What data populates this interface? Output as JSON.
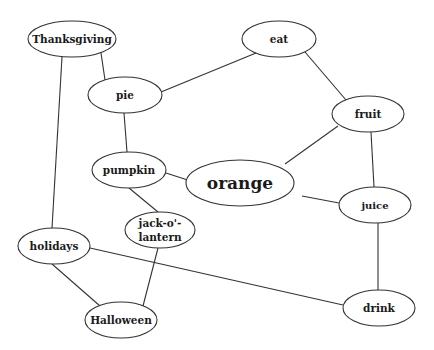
{
  "diagram": {
    "type": "concept-map",
    "nodes": [
      {
        "id": "thanksgiving",
        "label": "Thanksgiving",
        "cx": 72,
        "cy": 39,
        "rx": 44,
        "ry": 18,
        "size": 10.5
      },
      {
        "id": "eat",
        "label": "eat",
        "cx": 279,
        "cy": 39,
        "rx": 37,
        "ry": 18,
        "size": 10.5
      },
      {
        "id": "pie",
        "label": "pie",
        "cx": 125,
        "cy": 95,
        "rx": 37,
        "ry": 18,
        "size": 10.5
      },
      {
        "id": "fruit",
        "label": "fruit",
        "cx": 368,
        "cy": 114,
        "rx": 36,
        "ry": 18,
        "size": 10.5
      },
      {
        "id": "pumpkin",
        "label": "pumpkin",
        "cx": 129,
        "cy": 170,
        "rx": 37,
        "ry": 18,
        "size": 10.5
      },
      {
        "id": "orange",
        "label": "orange",
        "cx": 240,
        "cy": 183,
        "rx": 54,
        "ry": 23,
        "size": 17
      },
      {
        "id": "juice",
        "label": "juice",
        "cx": 375,
        "cy": 205,
        "rx": 36,
        "ry": 18,
        "size": 10
      },
      {
        "id": "jack",
        "label": "jack-o'-",
        "label2": "lantern",
        "cx": 160,
        "cy": 230,
        "rx": 35,
        "ry": 18,
        "size": 10.5
      },
      {
        "id": "holidays",
        "label": "holidays",
        "cx": 54,
        "cy": 246,
        "rx": 36,
        "ry": 18,
        "size": 10.5
      },
      {
        "id": "halloween",
        "label": "Halloween",
        "cx": 121,
        "cy": 320,
        "rx": 36,
        "ry": 18,
        "size": 10.5
      },
      {
        "id": "drink",
        "label": "drink",
        "cx": 379,
        "cy": 308,
        "rx": 36,
        "ry": 18,
        "size": 10.5
      }
    ],
    "edges": [
      {
        "from": "thanksgiving",
        "to": "pie",
        "x1": 101,
        "y1": 53,
        "x2": 105,
        "y2": 80
      },
      {
        "from": "thanksgiving",
        "to": "holidays",
        "x1": 62,
        "y1": 57,
        "x2": 52,
        "y2": 228
      },
      {
        "from": "eat",
        "to": "pie",
        "x1": 256,
        "y1": 53,
        "x2": 161,
        "y2": 92
      },
      {
        "from": "eat",
        "to": "fruit",
        "x1": 305,
        "y1": 52,
        "x2": 346,
        "y2": 100
      },
      {
        "from": "pie",
        "to": "pumpkin",
        "x1": 124,
        "y1": 113,
        "x2": 127,
        "y2": 152
      },
      {
        "from": "fruit",
        "to": "orange",
        "x1": 338,
        "y1": 126,
        "x2": 285,
        "y2": 164
      },
      {
        "from": "fruit",
        "to": "juice",
        "x1": 371,
        "y1": 132,
        "x2": 374,
        "y2": 187
      },
      {
        "from": "pumpkin",
        "to": "orange",
        "x1": 166,
        "y1": 173,
        "x2": 200,
        "y2": 184
      },
      {
        "from": "pumpkin",
        "to": "jack",
        "x1": 129,
        "y1": 188,
        "x2": 158,
        "y2": 212
      },
      {
        "from": "orange",
        "to": "juice",
        "x1": 302,
        "y1": 196,
        "x2": 339,
        "y2": 203
      },
      {
        "from": "juice",
        "to": "drink",
        "x1": 378,
        "y1": 223,
        "x2": 378,
        "y2": 290
      },
      {
        "from": "holidays",
        "to": "drink",
        "x1": 90,
        "y1": 248,
        "x2": 343,
        "y2": 305
      },
      {
        "from": "holidays",
        "to": "halloween",
        "x1": 52,
        "y1": 264,
        "x2": 100,
        "y2": 306
      },
      {
        "from": "jack",
        "to": "halloween",
        "x1": 158,
        "y1": 248,
        "x2": 143,
        "y2": 306
      }
    ]
  }
}
